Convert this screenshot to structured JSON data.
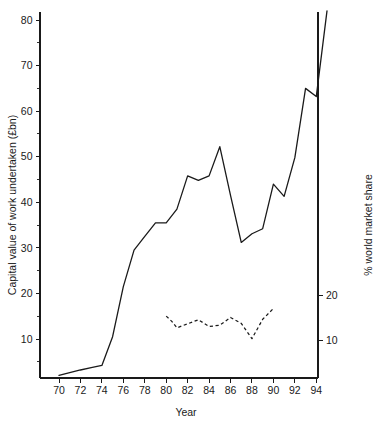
{
  "chart_data": {
    "type": "line",
    "title": "",
    "xlabel": "Year",
    "ylabel": "Capital value of work undertaken (£bn)",
    "y2label": "% world market share",
    "xlim": [
      69,
      95.6
    ],
    "ylim": [
      0.5,
      84
    ],
    "y2lim": [
      1.1,
      18.4
    ],
    "grid": false,
    "legend": "none",
    "x_ticks": [
      70,
      72,
      74,
      76,
      78,
      80,
      82,
      84,
      86,
      88,
      90,
      92,
      94
    ],
    "x_tick_labels": [
      "70",
      "72",
      "74",
      "76",
      "78",
      "80",
      "82",
      "84",
      "86",
      "88",
      "90",
      "92",
      "94"
    ],
    "y_ticks": [
      10,
      20,
      30,
      40,
      50,
      60,
      70,
      80
    ],
    "y_tick_labels": [
      "10",
      "20",
      "30",
      "40",
      "50",
      "60",
      "70",
      "80"
    ],
    "y_minor_ticks": [
      5,
      15,
      25,
      35,
      45,
      55,
      65,
      75
    ],
    "y2_ticks": [
      10,
      20
    ],
    "y2_tick_labels": [
      "10",
      "20"
    ],
    "series": [
      {
        "name": "Capital value of work undertaken",
        "axis": "left",
        "style": "solid",
        "x": [
          70,
          71,
          72,
          73,
          74,
          75,
          76,
          77,
          78,
          79,
          80,
          81,
          82,
          83,
          84,
          85,
          86,
          87,
          88,
          89,
          90,
          91,
          92,
          93,
          94,
          95
        ],
        "values": [
          2.0,
          2.6,
          3.2,
          3.7,
          4.2,
          10.5,
          21.5,
          29.5,
          32.5,
          35.5,
          35.5,
          38.5,
          45.8,
          44.8,
          45.8,
          52.2,
          41.5,
          31.2,
          33.1,
          34.2,
          44.0,
          41.3,
          49.8,
          65.0,
          63.2,
          82.0
        ]
      },
      {
        "name": "% world market share",
        "axis": "right",
        "style": "dashed",
        "x": [
          80,
          80.5,
          81,
          82,
          83,
          84,
          85,
          86,
          87,
          88,
          89,
          90
        ],
        "values": [
          15.3,
          14.2,
          12.7,
          13.6,
          14.5,
          13.0,
          13.3,
          15.0,
          13.7,
          10.3,
          14.6,
          17.0
        ]
      }
    ]
  },
  "axes": {
    "x_title": "Year",
    "y_title": "Capital value of work undertaken (£bn)",
    "y2_title": "% world market share"
  },
  "colors": {
    "ink": "#1a1a1a",
    "background": "#ffffff"
  }
}
